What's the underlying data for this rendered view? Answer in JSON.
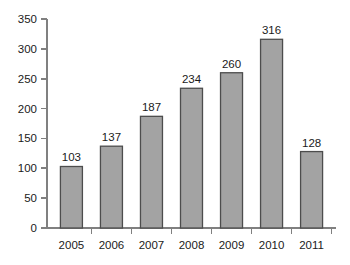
{
  "chart_data": {
    "type": "bar",
    "title": "",
    "subtitle": "",
    "xlabel": "",
    "ylabel": "",
    "categories": [
      "2005",
      "2006",
      "2007",
      "2008",
      "2009",
      "2010",
      "2011"
    ],
    "values": [
      103,
      137,
      187,
      234,
      260,
      316,
      128
    ],
    "value_labels": [
      "103",
      "137",
      "187",
      "234",
      "260",
      "316",
      "128"
    ],
    "ylim": [
      0,
      350
    ],
    "ytick_values": [
      0,
      50,
      100,
      150,
      200,
      250,
      300,
      350
    ],
    "ytick_labels": [
      "0",
      "50",
      "100",
      "150",
      "200",
      "250",
      "300",
      "350"
    ],
    "grid": false,
    "legend": false,
    "legend_position": "none",
    "bar_color": "#a3a3a3",
    "bar_edge_color": "#4d4d4d",
    "axis_color": "#808080",
    "text_color": "#1a1a1a",
    "background_color": "#ffffff"
  }
}
